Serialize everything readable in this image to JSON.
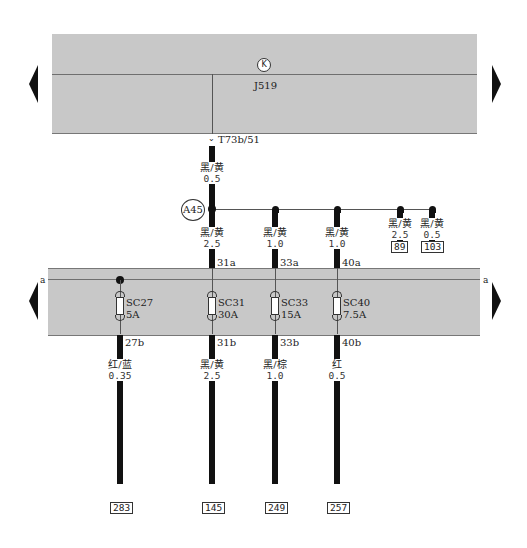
{
  "top_component": {
    "id": "J519",
    "symbol": "K",
    "connector_pin": "T73b/51"
  },
  "splice": {
    "id": "A45"
  },
  "fuse_box": {
    "edge_labels": {
      "left": "a",
      "right": "a"
    }
  },
  "wire_j519_to_a45": {
    "color": "黑/黄",
    "gauge": "0.5"
  },
  "branches": [
    {
      "color": "黑/黄",
      "gauge": "2.5",
      "pin_in": "31a"
    },
    {
      "color": "黑/黄",
      "gauge": "1.0",
      "pin_in": "33a"
    },
    {
      "color": "黑/黄",
      "gauge": "1.0",
      "pin_in": "40a"
    },
    {
      "color": "黑/黄",
      "gauge": "2.5",
      "ref": "89"
    },
    {
      "color": "黑/黄",
      "gauge": "0.5",
      "ref": "103"
    }
  ],
  "fuses": [
    {
      "id": "SC27",
      "rating": "5A",
      "pin_out": "27b",
      "out_color": "红/蓝",
      "out_gauge": "0.35",
      "ref": "283"
    },
    {
      "id": "SC31",
      "rating": "30A",
      "pin_out": "31b",
      "out_color": "黑/黄",
      "out_gauge": "2.5",
      "ref": "145"
    },
    {
      "id": "SC33",
      "rating": "15A",
      "pin_out": "33b",
      "out_color": "黑/棕",
      "out_gauge": "1.0",
      "ref": "249"
    },
    {
      "id": "SC40",
      "rating": "7.5A",
      "pin_out": "40b",
      "out_color": "红",
      "out_gauge": "0.5",
      "ref": "257"
    }
  ],
  "navigation": {
    "top_left_arrow": "previous-page",
    "top_right_arrow": "next-page",
    "bottom_left_arrow": "previous-page",
    "bottom_right_arrow": "next-page"
  },
  "colors": {
    "panel": "#c8c8c8",
    "wire": "#111111",
    "line": "#6f6f6f"
  }
}
